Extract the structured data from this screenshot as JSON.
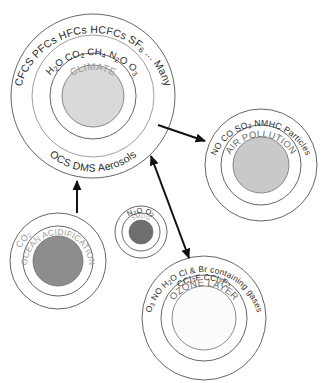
{
  "diagram": {
    "background_color": "#ffffff",
    "nodes": [
      {
        "id": "climate",
        "center_label": "CLIMATE",
        "outer_ring_label": "CFCS PFCs HFCs HCFCs SF6 ... Many",
        "middle_ring_label": "H2O  CO2   CH4   N2O   O3",
        "bottom_ring_label": "OCS DMS Aerosols",
        "core_color": "#d9d9d9",
        "cx": 93,
        "cy": 96,
        "r_outer": 82,
        "r_middle": 61,
        "r_inner": 43,
        "r_core": 31
      },
      {
        "id": "air-pollution",
        "center_label": "AIR POLLUTION",
        "outer_ring_label": "NO CO SO2 NMHC Particles",
        "core_color": "#c9c9c9",
        "cx": 261,
        "cy": 165,
        "r_outer": 56,
        "r_inner": 40,
        "r_core": 28
      },
      {
        "id": "ocean-acidification",
        "center_label": "OCEAN ACIDIFICATION",
        "outer_ring_label": "CO2",
        "core_color": "#8d8d8d",
        "cx": 58,
        "cy": 261,
        "r_outer": 48,
        "r_inner": 35,
        "r_core": 25
      },
      {
        "id": "smog",
        "center_label": "SMOG",
        "outer_ring_label": "N2O  O2",
        "core_color": "#6e6e6e",
        "cx": 141,
        "cy": 232,
        "r_outer": 26,
        "r_inner": 19,
        "r_core": 12
      },
      {
        "id": "ozone-layer",
        "center_label": "OZONE LAYER",
        "outer_ring_label": "O3 NO H2O Cl & Br containing gases",
        "outer_ring_label_2": "CCl3F CCl2F2",
        "core_color": "#fbfbfb",
        "cx": 204,
        "cy": 318,
        "r_outer": 62,
        "r_inner": 43,
        "r_core": 32
      }
    ],
    "connectors": [
      {
        "id": "climate-to-air-pollution",
        "label": "climate to air pollution",
        "heads": "single"
      },
      {
        "id": "climate-to-ozone-layer",
        "label": "climate to ozone layer",
        "heads": "double"
      },
      {
        "id": "ocean-acidification-to-climate",
        "label": "ocean acidification to climate",
        "heads": "single"
      }
    ]
  }
}
